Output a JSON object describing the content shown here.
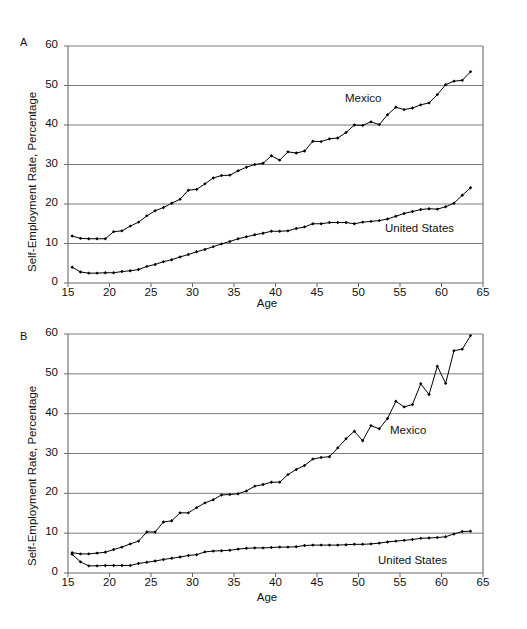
{
  "figure": {
    "panels": [
      {
        "id": "A",
        "label": "A",
        "ylabel": "Self-Employment Rate, Percentage",
        "xlabel": "Age",
        "series_labels": {
          "mexico": "Mexico",
          "united_states": "United States"
        }
      },
      {
        "id": "B",
        "label": "B",
        "ylabel": "Self-Employment Rate, Percentage",
        "xlabel": "Age",
        "series_labels": {
          "mexico": "Mexico",
          "united_states": "United States"
        }
      }
    ]
  },
  "chart_data": [
    {
      "panel": "A",
      "type": "line",
      "title": "",
      "xlabel": "Age",
      "ylabel": "Self-Employment Rate, Percentage",
      "xlim": [
        15,
        65
      ],
      "ylim": [
        0,
        60
      ],
      "xticks": [
        15,
        20,
        25,
        30,
        35,
        40,
        45,
        50,
        55,
        60,
        65
      ],
      "yticks": [
        0,
        10,
        20,
        30,
        40,
        50,
        60
      ],
      "grid": "horizontal",
      "legend": "inline-annotation",
      "x": [
        15.5,
        16.5,
        17.5,
        18.5,
        19.5,
        20.5,
        21.5,
        22.5,
        23.5,
        24.5,
        25.5,
        26.5,
        27.5,
        28.5,
        29.5,
        30.5,
        31.5,
        32.5,
        33.5,
        34.5,
        35.5,
        36.5,
        37.5,
        38.5,
        39.5,
        40.5,
        41.5,
        42.5,
        43.5,
        44.5,
        45.5,
        46.5,
        47.5,
        48.5,
        49.5,
        50.5,
        51.5,
        52.5,
        53.5,
        54.5,
        55.5,
        56.5,
        57.5,
        58.5,
        59.5,
        60.5,
        61.5,
        62.5,
        63.5
      ],
      "series": [
        {
          "name": "Mexico",
          "values": [
            11.9,
            11.3,
            11.2,
            11.2,
            11.2,
            13.0,
            13.2,
            14.4,
            15.4,
            17.0,
            18.3,
            19.1,
            20.2,
            21.2,
            23.5,
            23.7,
            25.1,
            26.6,
            27.2,
            27.3,
            28.4,
            29.3,
            30.0,
            30.3,
            32.2,
            31.1,
            33.2,
            32.9,
            33.4,
            35.9,
            35.8,
            36.5,
            36.7,
            38.1,
            40.0,
            39.9,
            40.8,
            40.1,
            42.6,
            44.5,
            43.9,
            44.3,
            45.1,
            45.6,
            47.7,
            50.2,
            51.1,
            51.3,
            53.5
          ]
        },
        {
          "name": "United States",
          "values": [
            4.0,
            2.8,
            2.5,
            2.5,
            2.6,
            2.6,
            2.9,
            3.1,
            3.4,
            4.2,
            4.7,
            5.4,
            5.9,
            6.6,
            7.2,
            7.9,
            8.5,
            9.2,
            9.9,
            10.5,
            11.2,
            11.7,
            12.2,
            12.6,
            13.1,
            13.1,
            13.2,
            13.8,
            14.2,
            15.0,
            15.0,
            15.3,
            15.3,
            15.3,
            15.0,
            15.4,
            15.6,
            15.8,
            16.2,
            16.9,
            17.6,
            18.1,
            18.6,
            18.8,
            18.7,
            19.3,
            20.2,
            22.2,
            24.1
          ]
        }
      ]
    },
    {
      "panel": "B",
      "type": "line",
      "title": "",
      "xlabel": "Age",
      "ylabel": "Self-Employment Rate, Percentage",
      "xlim": [
        15,
        65
      ],
      "ylim": [
        0,
        60
      ],
      "xticks": [
        15,
        20,
        25,
        30,
        35,
        40,
        45,
        50,
        55,
        60,
        65
      ],
      "yticks": [
        0,
        10,
        20,
        30,
        40,
        50,
        60
      ],
      "grid": "horizontal",
      "legend": "inline-annotation",
      "x": [
        15.5,
        16.5,
        17.5,
        18.5,
        19.5,
        20.5,
        21.5,
        22.5,
        23.5,
        24.5,
        25.5,
        26.5,
        27.5,
        28.5,
        29.5,
        30.5,
        31.5,
        32.5,
        33.5,
        34.5,
        35.5,
        36.5,
        37.5,
        38.5,
        39.5,
        40.5,
        41.5,
        42.5,
        43.5,
        44.5,
        45.5,
        46.5,
        47.5,
        48.5,
        49.5,
        50.5,
        51.5,
        52.5,
        53.5,
        54.5,
        55.5,
        56.5,
        57.5,
        58.5,
        59.5,
        60.5,
        61.5,
        62.5,
        63.5
      ],
      "series": [
        {
          "name": "Mexico",
          "values": [
            5.1,
            4.8,
            4.8,
            5.0,
            5.2,
            5.9,
            6.5,
            7.3,
            8.0,
            10.3,
            10.3,
            12.8,
            13.1,
            15.1,
            15.1,
            16.4,
            17.6,
            18.4,
            19.6,
            19.7,
            19.9,
            20.6,
            21.8,
            22.2,
            22.8,
            22.8,
            24.7,
            26.0,
            27.0,
            28.6,
            29.0,
            29.2,
            31.4,
            33.7,
            35.6,
            33.2,
            37.0,
            36.2,
            38.8,
            43.1,
            41.7,
            42.3,
            47.5,
            44.8,
            51.9,
            47.6,
            55.8,
            56.2,
            59.6
          ]
        },
        {
          "name": "United States",
          "values": [
            4.7,
            2.8,
            1.8,
            1.8,
            1.9,
            1.9,
            1.9,
            1.9,
            2.4,
            2.7,
            3.0,
            3.4,
            3.7,
            4.0,
            4.4,
            4.6,
            5.3,
            5.5,
            5.6,
            5.7,
            6.0,
            6.2,
            6.3,
            6.3,
            6.4,
            6.5,
            6.5,
            6.6,
            6.9,
            7.0,
            7.0,
            7.0,
            7.0,
            7.1,
            7.2,
            7.2,
            7.3,
            7.5,
            7.8,
            8.0,
            8.2,
            8.4,
            8.7,
            8.8,
            8.9,
            9.1,
            9.8,
            10.4,
            10.5
          ]
        }
      ]
    }
  ]
}
